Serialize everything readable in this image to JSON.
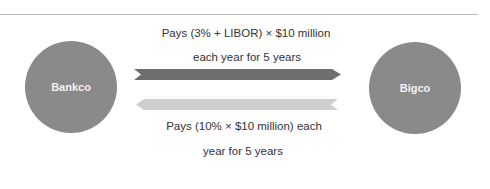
{
  "entities": {
    "left": {
      "name": "Bankco",
      "color": "#8a8a8a"
    },
    "right": {
      "name": "Bigco",
      "color": "#8a8a8a"
    }
  },
  "flows": [
    {
      "direction": "Bankco to Bigco",
      "color": "#6e6e6e",
      "label_line1": "Pays (3% + LIBOR) × $10 million",
      "label_line2": "each year for 5 years"
    },
    {
      "direction": "Bigco to Bankco",
      "color": "#cfcfcf",
      "label_line1": "Pays (10% × $10 million) each",
      "label_line2": "year for 5 years"
    }
  ]
}
